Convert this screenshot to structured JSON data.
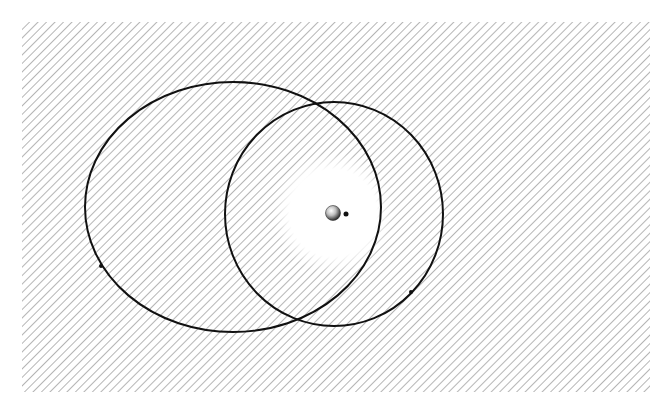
{
  "figure": {
    "width": 667,
    "height": 413,
    "background": "#ffffff",
    "hatch_region": {
      "x": 22,
      "y": 22,
      "width": 628,
      "height": 370
    },
    "hatch_color": "#6e6e6e",
    "cross_hatch_color": "#5a5a5a",
    "orbit_color": "#111111"
  },
  "halo": {
    "cx": 333,
    "cy": 213,
    "outer_r": 145,
    "inner_r": 50
  },
  "central_body": {
    "cx": 333,
    "cy": 213,
    "r": 7.5
  },
  "moon": {
    "cx": 346,
    "cy": 214,
    "r": 2.5
  },
  "orbits": [
    {
      "name": "elliptical-orbit",
      "cx": 233,
      "cy": 207,
      "rx": 148,
      "ry": 125
    },
    {
      "name": "circular-orbit",
      "cx": 334,
      "cy": 214,
      "rx": 109,
      "ry": 112
    }
  ],
  "orbit_markers": [
    {
      "name": "marker-on-elliptical-orbit",
      "cx": 101,
      "cy": 266,
      "r": 2
    },
    {
      "name": "marker-on-circular-orbit",
      "cx": 411,
      "cy": 292,
      "r": 2
    }
  ]
}
